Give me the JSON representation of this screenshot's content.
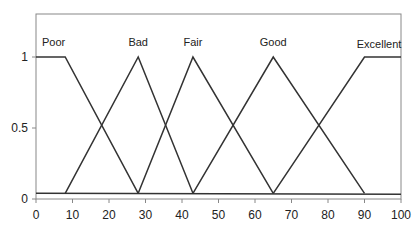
{
  "chart_data": {
    "type": "line",
    "title": "",
    "xlabel": "",
    "ylabel": "",
    "xlim": [
      0,
      100
    ],
    "ylim": [
      0,
      1.2
    ],
    "x_ticks": [
      0,
      10,
      20,
      30,
      40,
      50,
      60,
      70,
      80,
      90,
      100
    ],
    "y_ticks": [
      {
        "value": 0,
        "label": "0"
      },
      {
        "value": 0.5,
        "label": "0.5"
      },
      {
        "value": 1,
        "label": "1"
      }
    ],
    "grid": false,
    "legend": "none",
    "baseline_value": 0.04,
    "series": [
      {
        "name": "Poor",
        "x": [
          0,
          8,
          28
        ],
        "y": [
          1,
          1,
          0.04
        ],
        "label_pos": [
          4,
          1.06
        ]
      },
      {
        "name": "Bad",
        "x": [
          8,
          28,
          43
        ],
        "y": [
          0.04,
          1,
          0.04
        ],
        "label_pos": [
          28,
          1.06
        ]
      },
      {
        "name": "Fair",
        "x": [
          28,
          43,
          65
        ],
        "y": [
          0.04,
          1,
          0.04
        ],
        "label_pos": [
          43,
          1.06
        ]
      },
      {
        "name": "Good",
        "x": [
          43,
          65,
          90
        ],
        "y": [
          0.04,
          1,
          0.04
        ],
        "label_pos": [
          65,
          1.06
        ]
      },
      {
        "name": "Excellent",
        "x": [
          65,
          90,
          100
        ],
        "y": [
          0.04,
          1,
          1
        ],
        "label_pos": [
          94,
          1.05
        ]
      }
    ],
    "line_color": "#333333"
  }
}
